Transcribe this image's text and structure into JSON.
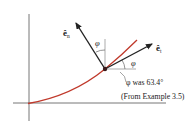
{
  "diagram": {
    "vectors": {
      "normal": {
        "symbol": "ê",
        "subscript": "n"
      },
      "tangent": {
        "symbol": "ê",
        "subscript": "t"
      }
    },
    "angle_labels": {
      "normal_angle": "φ",
      "tangent_angle": "φ"
    },
    "annotation": {
      "line1": "φ was 63.4°",
      "line2": "(From Example 3.5)"
    },
    "colors": {
      "curve": "#c0392b",
      "vectors": "#222222",
      "axes": "#555555",
      "reference_lines": "#777777"
    }
  }
}
